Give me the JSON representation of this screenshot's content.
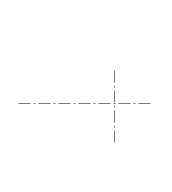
{
  "diagram": {
    "type": "centerlines",
    "line_color": "#7a7a7a",
    "line_style": "dash-dot",
    "dash_pattern": [
      12,
      3,
      2,
      3
    ],
    "horizontal_centerline": {
      "x1": 18,
      "y1": 103,
      "x2": 150,
      "y2": 103
    },
    "vertical_centerline": {
      "x1": 114,
      "y1": 70,
      "x2": 114,
      "y2": 142
    },
    "intersection": {
      "x": 114,
      "y": 103
    }
  }
}
